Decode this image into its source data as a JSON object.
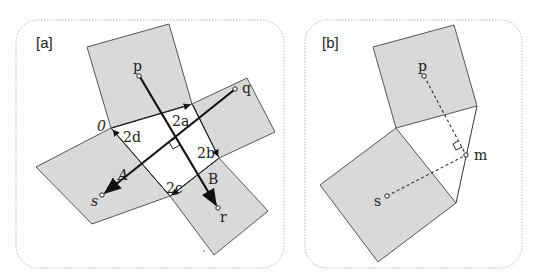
{
  "panels": [
    {
      "id": "a",
      "label": "[a]",
      "points": {
        "p": "p",
        "q": "q",
        "r": "r",
        "s": "s",
        "O": "0"
      },
      "segment_labels": {
        "a": "2a",
        "b": "2b",
        "c": "2c",
        "d": "2d"
      },
      "intersection_labels": {
        "A": "A",
        "B": "B"
      }
    },
    {
      "id": "b",
      "label": "[b]",
      "points": {
        "p": "p",
        "s": "s",
        "m": "m"
      }
    }
  ],
  "colors": {
    "square_fill": "#d9d9d9",
    "stroke": "#333333",
    "frame": "#b8b8b8"
  }
}
